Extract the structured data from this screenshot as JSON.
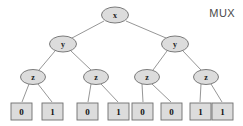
{
  "figure": {
    "caption": "MUX",
    "background_color": "#ffffff",
    "node_fill_color": "#dcdcdc",
    "node_stroke_color": "#6e6e6e",
    "edge_color": "#8a8a8a",
    "text_color": "#111111"
  },
  "chart_data": {
    "type": "diagram",
    "diagram_kind": "binary-decision-tree",
    "title": "MUX",
    "levels": [
      {
        "variable": "x",
        "node_count": 1
      },
      {
        "variable": "y",
        "node_count": 2
      },
      {
        "variable": "z",
        "node_count": 4
      },
      {
        "variable": "leaf",
        "node_count": 8
      }
    ],
    "nodes": [
      {
        "id": "n0",
        "label": "x",
        "level": 0,
        "shape": "ellipse",
        "cx": 115,
        "cy": 15,
        "rx": 13.5,
        "ry": 8
      },
      {
        "id": "n1",
        "label": "y",
        "level": 1,
        "shape": "ellipse",
        "cx": 63,
        "cy": 44,
        "rx": 13.5,
        "ry": 8
      },
      {
        "id": "n2",
        "label": "y",
        "level": 1,
        "shape": "ellipse",
        "cx": 175,
        "cy": 44,
        "rx": 13.5,
        "ry": 8
      },
      {
        "id": "n3",
        "label": "z",
        "level": 2,
        "shape": "ellipse",
        "cx": 33,
        "cy": 77,
        "rx": 12.5,
        "ry": 7.5
      },
      {
        "id": "n4",
        "label": "z",
        "level": 2,
        "shape": "ellipse",
        "cx": 96,
        "cy": 77,
        "rx": 12.5,
        "ry": 7.5
      },
      {
        "id": "n5",
        "label": "z",
        "level": 2,
        "shape": "ellipse",
        "cx": 147,
        "cy": 77,
        "rx": 12.5,
        "ry": 7.5
      },
      {
        "id": "n6",
        "label": "z",
        "level": 2,
        "shape": "ellipse",
        "cx": 206,
        "cy": 77,
        "rx": 12.5,
        "ry": 7.5
      },
      {
        "id": "l0",
        "label": "0",
        "level": 3,
        "shape": "rect",
        "x": 11,
        "y": 103,
        "w": 21,
        "h": 17
      },
      {
        "id": "l1",
        "label": "1",
        "level": 3,
        "shape": "rect",
        "x": 42,
        "y": 103,
        "w": 21,
        "h": 17
      },
      {
        "id": "l2",
        "label": "0",
        "level": 3,
        "shape": "rect",
        "x": 77,
        "y": 103,
        "w": 21,
        "h": 17
      },
      {
        "id": "l3",
        "label": "1",
        "level": 3,
        "shape": "rect",
        "x": 108,
        "y": 103,
        "w": 21,
        "h": 17
      },
      {
        "id": "l4",
        "label": "0",
        "level": 3,
        "shape": "rect",
        "x": 132,
        "y": 103,
        "w": 21,
        "h": 17
      },
      {
        "id": "l5",
        "label": "0",
        "level": 3,
        "shape": "rect",
        "x": 161,
        "y": 103,
        "w": 21,
        "h": 17
      },
      {
        "id": "l6",
        "label": "1",
        "level": 3,
        "shape": "rect",
        "x": 190,
        "y": 103,
        "w": 21,
        "h": 17
      },
      {
        "id": "l7",
        "label": "1",
        "level": 3,
        "shape": "rect",
        "x": 212,
        "y": 103,
        "w": 21,
        "h": 17
      }
    ],
    "edges": [
      {
        "from": "n0",
        "to": "n1",
        "x1": 104,
        "y1": 21,
        "x2": 72,
        "y2": 38
      },
      {
        "from": "n0",
        "to": "n2",
        "x1": 126,
        "y1": 21,
        "x2": 166,
        "y2": 38
      },
      {
        "from": "n1",
        "to": "n3",
        "x1": 55,
        "y1": 51,
        "x2": 39,
        "y2": 70
      },
      {
        "from": "n1",
        "to": "n4",
        "x1": 71,
        "y1": 51,
        "x2": 91,
        "y2": 70
      },
      {
        "from": "n2",
        "to": "n5",
        "x1": 167,
        "y1": 51,
        "x2": 153,
        "y2": 70
      },
      {
        "from": "n2",
        "to": "n6",
        "x1": 183,
        "y1": 51,
        "x2": 201,
        "y2": 70
      },
      {
        "from": "n3",
        "to": "l0",
        "x1": 29,
        "y1": 84,
        "x2": 22,
        "y2": 102
      },
      {
        "from": "n3",
        "to": "l1",
        "x1": 38,
        "y1": 84,
        "x2": 52,
        "y2": 102
      },
      {
        "from": "n4",
        "to": "l2",
        "x1": 91,
        "y1": 84,
        "x2": 88,
        "y2": 102
      },
      {
        "from": "n4",
        "to": "l3",
        "x1": 101,
        "y1": 84,
        "x2": 118,
        "y2": 102
      },
      {
        "from": "n5",
        "to": "l4",
        "x1": 142,
        "y1": 84,
        "x2": 143,
        "y2": 102
      },
      {
        "from": "n5",
        "to": "l5",
        "x1": 152,
        "y1": 84,
        "x2": 171,
        "y2": 102
      },
      {
        "from": "n6",
        "to": "l6",
        "x1": 201,
        "y1": 84,
        "x2": 200,
        "y2": 102
      },
      {
        "from": "n6",
        "to": "l7",
        "x1": 211,
        "y1": 84,
        "x2": 222,
        "y2": 102
      }
    ],
    "leaf_values": [
      "0",
      "1",
      "0",
      "1",
      "0",
      "0",
      "1",
      "1"
    ],
    "variables": [
      "x",
      "y",
      "z"
    ]
  }
}
